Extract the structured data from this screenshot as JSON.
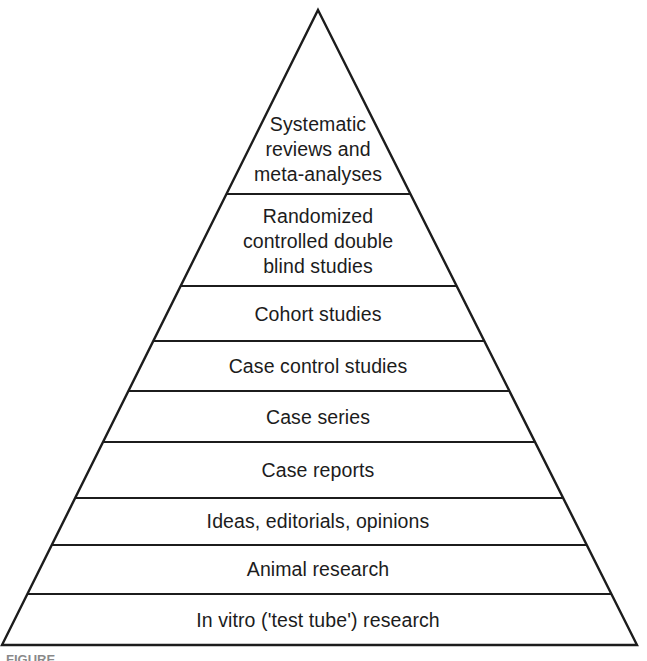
{
  "figure": {
    "kind": "evidence-hierarchy-pyramid",
    "background_color": "#ffffff",
    "line_color": "#1c1c1c",
    "text_color": "#1c1c1c",
    "caption_prefix": "FIGURE",
    "caption_text": "FIGURE"
  },
  "pyramid": {
    "apex_x": 318,
    "apex_y": 10,
    "base_left_x": 2,
    "base_right_x": 637,
    "base_y": 645,
    "tiers": [
      {
        "rank": 1,
        "label": "Systematic\nreviews and\nmeta-analyses",
        "top_y": 103,
        "bottom_y": 194,
        "center_y": 149
      },
      {
        "rank": 2,
        "label": "Randomized\ncontrolled double\nblind studies",
        "top_y": 194,
        "bottom_y": 286,
        "center_y": 241
      },
      {
        "rank": 3,
        "label": "Cohort studies",
        "top_y": 286,
        "bottom_y": 341,
        "center_y": 314
      },
      {
        "rank": 4,
        "label": "Case control studies",
        "top_y": 341,
        "bottom_y": 391,
        "center_y": 366
      },
      {
        "rank": 5,
        "label": "Case series",
        "top_y": 391,
        "bottom_y": 442,
        "center_y": 417
      },
      {
        "rank": 6,
        "label": "Case reports",
        "top_y": 442,
        "bottom_y": 498,
        "center_y": 470
      },
      {
        "rank": 7,
        "label": "Ideas, editorials, opinions",
        "top_y": 498,
        "bottom_y": 545,
        "center_y": 521
      },
      {
        "rank": 8,
        "label": "Animal research",
        "top_y": 545,
        "bottom_y": 594,
        "center_y": 569
      },
      {
        "rank": 9,
        "label": "In vitro ('test tube') research",
        "top_y": 594,
        "bottom_y": 645,
        "center_y": 620
      }
    ],
    "divider_ys": [
      194,
      286,
      341,
      391,
      442,
      498,
      545,
      594
    ]
  }
}
